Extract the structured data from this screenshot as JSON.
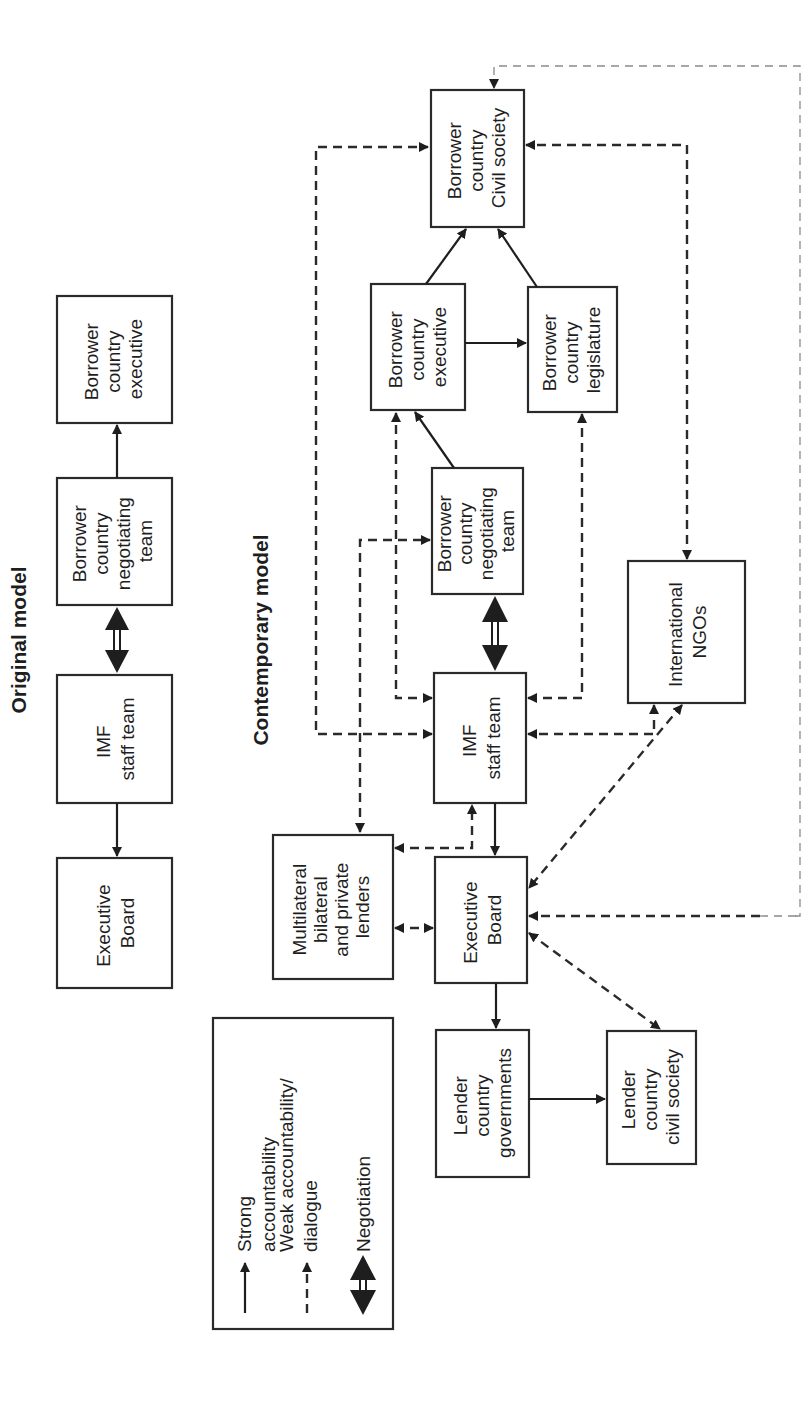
{
  "original_model": {
    "title": "Original model",
    "boxes": {
      "executive_board": [
        "Executive",
        "Board"
      ],
      "imf_staff_team": [
        "IMF",
        "staff team"
      ],
      "negotiating_team": [
        "Borrower",
        "country",
        "negotiating",
        "team"
      ],
      "borrower_executive": [
        "Borrower",
        "country",
        "executive"
      ]
    },
    "relations": [
      {
        "from": "imf_staff_team",
        "to": "executive_board",
        "type": "strong"
      },
      {
        "from": "imf_staff_team",
        "to": "negotiating_team",
        "type": "negotiation"
      },
      {
        "from": "negotiating_team",
        "to": "borrower_executive",
        "type": "strong"
      }
    ]
  },
  "contemporary_model": {
    "title": "Contemporary model",
    "boxes": {
      "civil_society": [
        "Borrower",
        "country",
        "Civil society"
      ],
      "borrower_executive": [
        "Borrower",
        "country",
        "executive"
      ],
      "borrower_legislature": [
        "Borrower",
        "country",
        "legislature"
      ],
      "negotiating_team": [
        "Borrower",
        "country",
        "negotiating",
        "team"
      ],
      "imf_staff_team": [
        "IMF",
        "staff team"
      ],
      "international_ngos": [
        "International",
        "NGOs"
      ],
      "lenders": [
        "Multilateral",
        "bilateral",
        "and private",
        "lenders"
      ],
      "executive_board": [
        "Executive",
        "Board"
      ],
      "lender_governments": [
        "Lender",
        "country",
        "governments"
      ],
      "lender_civil_society": [
        "Lender",
        "country",
        "civil society"
      ]
    },
    "relations": [
      {
        "from": "borrower_executive",
        "to": "civil_society",
        "type": "strong"
      },
      {
        "from": "borrower_legislature",
        "to": "civil_society",
        "type": "strong"
      },
      {
        "from": "borrower_executive",
        "to": "borrower_legislature",
        "type": "strong"
      },
      {
        "from": "negotiating_team",
        "to": "borrower_executive",
        "type": "strong"
      },
      {
        "from": "imf_staff_team",
        "to": "negotiating_team",
        "type": "negotiation"
      },
      {
        "from": "imf_staff_team",
        "to": "executive_board",
        "type": "strong"
      },
      {
        "from": "executive_board",
        "to": "lender_governments",
        "type": "strong"
      },
      {
        "from": "lender_governments",
        "to": "lender_civil_society",
        "type": "strong"
      },
      {
        "from": "imf_staff_team",
        "to": "civil_society",
        "type": "weak"
      },
      {
        "from": "imf_staff_team",
        "to": "borrower_executive",
        "type": "weak"
      },
      {
        "from": "imf_staff_team",
        "to": "borrower_legislature",
        "type": "weak"
      },
      {
        "from": "international_ngos",
        "to": "civil_society",
        "type": "weak"
      },
      {
        "from": "international_ngos",
        "to": "imf_staff_team",
        "type": "weak"
      },
      {
        "from": "international_ngos",
        "to": "executive_board",
        "type": "weak"
      },
      {
        "from": "lenders",
        "to": "negotiating_team",
        "type": "weak"
      },
      {
        "from": "lenders",
        "to": "imf_staff_team",
        "type": "weak"
      },
      {
        "from": "lenders",
        "to": "executive_board",
        "type": "weak"
      },
      {
        "from": "executive_board",
        "to": "lender_civil_society",
        "type": "weak"
      },
      {
        "from": "executive_board",
        "to": "civil_society",
        "type": "weak"
      }
    ]
  },
  "legend": {
    "strong": [
      "Strong",
      "accountability"
    ],
    "weak": [
      "Weak accountability/",
      "dialogue"
    ],
    "negotiation": [
      "Negotiation"
    ]
  },
  "colors": {
    "ink": "#1e1e1e",
    "background": "#ffffff",
    "faint_dash": "#8a8a8a"
  }
}
